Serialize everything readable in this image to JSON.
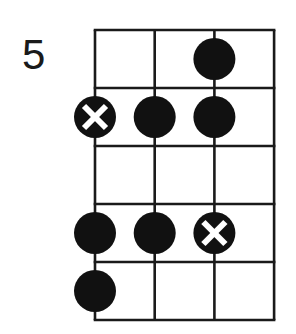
{
  "diagram": {
    "type": "fretboard-scale-diagram",
    "fret_label": "5",
    "strings": 4,
    "frets": 5,
    "colors": {
      "line": "#1a1a1a",
      "dot": "#111111",
      "background": "#ffffff",
      "root_mark": "#ffffff"
    },
    "notes": [
      {
        "fret": 1,
        "string": 3,
        "root": false
      },
      {
        "fret": 2,
        "string": 1,
        "root": true
      },
      {
        "fret": 2,
        "string": 2,
        "root": false
      },
      {
        "fret": 2,
        "string": 3,
        "root": false
      },
      {
        "fret": 4,
        "string": 1,
        "root": false
      },
      {
        "fret": 4,
        "string": 2,
        "root": false
      },
      {
        "fret": 4,
        "string": 3,
        "root": true
      },
      {
        "fret": 5,
        "string": 1,
        "root": false
      }
    ]
  }
}
